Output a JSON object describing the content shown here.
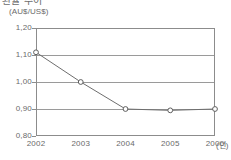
{
  "title": "환율 추이",
  "unit_label": "(AU$/US$)",
  "xaxis_unit": "(년)",
  "colors": {
    "frame": "#8c8c8c",
    "grid": "#9a9a9a",
    "line": "#6e6e6e",
    "marker_fill": "#ffffff",
    "marker_stroke": "#5f5f5f",
    "text": "#6a6a6a",
    "background": "#ffffff"
  },
  "chart_data": {
    "type": "line",
    "title": "환율 추이",
    "xlabel": "(년)",
    "ylabel": "(AU$/US$)",
    "categories": [
      "2002",
      "2003",
      "2004",
      "2005",
      "2006"
    ],
    "values": [
      1.11,
      1.0,
      0.9,
      0.895,
      0.9
    ],
    "ylim": [
      0.8,
      1.2
    ],
    "yticks": [
      "0,80",
      "0,90",
      "1,00",
      "1,10",
      "1,20"
    ],
    "ytick_values": [
      0.8,
      0.9,
      1.0,
      1.1,
      1.2
    ],
    "gridlines": [
      0.9,
      1.0,
      1.1
    ],
    "grid": true,
    "legend": "none",
    "marker": "open-circle",
    "series": [
      {
        "name": "AU$/US$",
        "values": [
          1.11,
          1.0,
          0.9,
          0.895,
          0.9
        ]
      }
    ]
  }
}
